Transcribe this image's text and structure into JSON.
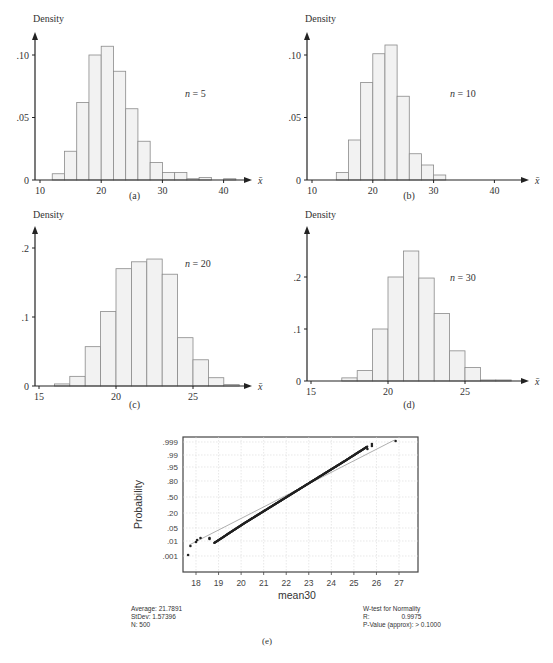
{
  "figure": {
    "panels": [
      {
        "id": "a",
        "caption": "(a)",
        "ylabel": "Density",
        "xlabel": "x̄",
        "annotation": "n = 5"
      },
      {
        "id": "b",
        "caption": "(b)",
        "ylabel": "Density",
        "xlabel": "x̄",
        "annotation": "n = 10"
      },
      {
        "id": "c",
        "caption": "(c)",
        "ylabel": "Density",
        "xlabel": "x̄",
        "annotation": "n = 20"
      },
      {
        "id": "d",
        "caption": "(d)",
        "ylabel": "Density",
        "xlabel": "x̄",
        "annotation": "n = 30"
      },
      {
        "id": "e",
        "caption": "(e)",
        "ylabel": "Probability",
        "xlabel": "mean30"
      }
    ],
    "stats_left": {
      "average": "Average: 21.7891",
      "stdev": "StDev: 1.57396",
      "n": "N: 500"
    },
    "stats_right": {
      "title": "W-test for Normality",
      "r_label": "R:",
      "r_value": "0.9975",
      "pvalue": "P-Value (approx): > 0.1000"
    },
    "colors": {
      "bar_fill": "#f2f2f2",
      "bar_stroke": "#8a8a8a",
      "axis": "#222222",
      "grid": "#d8d8d8",
      "fit_line": "#9a9a9a",
      "points": "#222222"
    }
  },
  "chart_data": [
    {
      "type": "bar",
      "title": "(a) n = 5",
      "xlabel": "x̄",
      "ylabel": "Density",
      "bin_edges": [
        12,
        14,
        16,
        18,
        20,
        22,
        24,
        26,
        28,
        30,
        32,
        34,
        36,
        38,
        40,
        42
      ],
      "values": [
        0.005,
        0.023,
        0.062,
        0.1,
        0.107,
        0.087,
        0.057,
        0.031,
        0.014,
        0.006,
        0.006,
        0.001,
        0.002,
        0.0,
        0.001
      ],
      "xticks": [
        10,
        20,
        30,
        40
      ],
      "yticks": [
        "0",
        ".05",
        ".10"
      ],
      "xlim": [
        10,
        45
      ],
      "ylim": [
        0,
        0.12
      ]
    },
    {
      "type": "bar",
      "title": "(b) n = 10",
      "xlabel": "x̄",
      "ylabel": "Density",
      "bin_edges": [
        14,
        16,
        18,
        20,
        22,
        24,
        26,
        28,
        30,
        32
      ],
      "values": [
        0.006,
        0.032,
        0.078,
        0.101,
        0.108,
        0.067,
        0.021,
        0.012,
        0.004
      ],
      "xticks": [
        10,
        20,
        30,
        40
      ],
      "yticks": [
        "0",
        ".05",
        ".10"
      ],
      "xlim": [
        10,
        45
      ],
      "ylim": [
        0,
        0.12
      ]
    },
    {
      "type": "bar",
      "title": "(c) n = 20",
      "xlabel": "x̄",
      "ylabel": "Density",
      "bin_edges": [
        16,
        17,
        18,
        19,
        20,
        21,
        22,
        23,
        24,
        25,
        26,
        27,
        28
      ],
      "values": [
        0.003,
        0.014,
        0.057,
        0.108,
        0.17,
        0.18,
        0.184,
        0.162,
        0.07,
        0.038,
        0.012,
        0.002
      ],
      "xticks": [
        15,
        20,
        25
      ],
      "yticks": [
        "0",
        ".1",
        ".2"
      ],
      "xlim": [
        15,
        29
      ],
      "ylim": [
        0,
        0.22
      ]
    },
    {
      "type": "bar",
      "title": "(d) n = 30",
      "xlabel": "x̄",
      "ylabel": "Density",
      "bin_edges": [
        17,
        18,
        19,
        20,
        21,
        22,
        23,
        24,
        25,
        26,
        27,
        28
      ],
      "values": [
        0.006,
        0.02,
        0.1,
        0.2,
        0.25,
        0.198,
        0.13,
        0.058,
        0.026,
        0.002,
        0.002
      ],
      "xticks": [
        15,
        20,
        25
      ],
      "yticks": [
        "0",
        ".1",
        ".2"
      ],
      "xlim": [
        15,
        29
      ],
      "ylim": [
        0,
        0.27
      ]
    },
    {
      "type": "scatter",
      "title": "(e) Normal probability plot",
      "xlabel": "mean30",
      "ylabel": "Probability",
      "xticks": [
        18,
        19,
        20,
        21,
        22,
        23,
        24,
        25,
        26,
        27
      ],
      "yticks": [
        ".001",
        ".01",
        ".05",
        ".20",
        ".50",
        ".80",
        ".95",
        ".99",
        ".999"
      ],
      "xlim": [
        17.3,
        27.3
      ],
      "fit_line": {
        "x": [
          17.7,
          26.8
        ],
        "p": [
          0.003,
          0.998
        ]
      },
      "annotations": [
        "Average: 21.7891",
        "StDev: 1.57396",
        "N: 500",
        "W-test for Normality",
        "R: 0.9975",
        "P-Value (approx): > 0.1000"
      ]
    }
  ]
}
